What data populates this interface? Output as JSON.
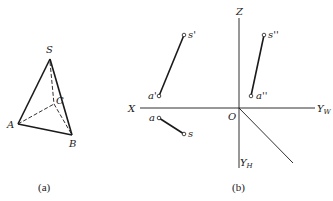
{
  "figure_a": {
    "caption": "(a)",
    "vertices": {
      "S": {
        "label": "S",
        "x": 50,
        "y": 59
      },
      "A": {
        "label": "A",
        "x": 18,
        "y": 124
      },
      "B": {
        "label": "B",
        "x": 72,
        "y": 135
      },
      "C": {
        "label": "C",
        "x": 54,
        "y": 104
      }
    },
    "solid_edges": [
      [
        "S",
        "A"
      ],
      [
        "S",
        "B"
      ],
      [
        "A",
        "B"
      ]
    ],
    "hidden_edges": [
      [
        "S",
        "C"
      ],
      [
        "A",
        "C"
      ],
      [
        "C",
        "B"
      ]
    ]
  },
  "figure_b": {
    "caption": "(b)",
    "axes": {
      "origin_label": "O",
      "x_label": "X",
      "z_label": "Z",
      "yw_label": "Y",
      "yw_sub": "W",
      "yh_label": "Y",
      "yh_sub": "H"
    },
    "points": {
      "s_prime": {
        "label": "s'",
        "x": 184,
        "y": 35
      },
      "a_prime": {
        "label": "a'",
        "x": 159,
        "y": 96
      },
      "a": {
        "label": "a",
        "x": 159,
        "y": 118
      },
      "s": {
        "label": "s",
        "x": 184,
        "y": 134
      },
      "s_dprime": {
        "label": "s''",
        "x": 264,
        "y": 35
      },
      "a_dprime": {
        "label": "a''",
        "x": 251,
        "y": 96
      }
    }
  },
  "colors": {
    "ink": "#1a1a1a",
    "background": "#ffffff"
  }
}
